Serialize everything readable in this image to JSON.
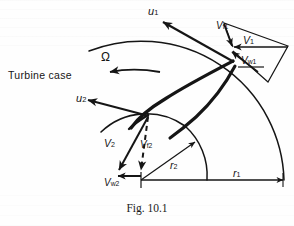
{
  "figure": {
    "caption": "Fig. 10.1",
    "ink_color": "#151515",
    "background_color": "#fefefe"
  },
  "annotations": {
    "turbine_case": "Turbine case",
    "omega": "Ω",
    "blade_speed_inlet": "u",
    "blade_speed_inlet_sub": "1",
    "blade_speed_outlet": "u",
    "blade_speed_outlet_sub": "2",
    "abs_velocity_inlet": "V",
    "abs_velocity_inlet_sub": "1",
    "flow_velocity_inlet": "V",
    "flow_velocity_inlet_sub": "f1",
    "whirl_velocity_inlet": "V",
    "whirl_velocity_inlet_sub": "w1",
    "abs_velocity_outlet": "V",
    "abs_velocity_outlet_sub": "2",
    "flow_velocity_outlet": "V",
    "flow_velocity_outlet_sub": "f2",
    "whirl_velocity_outlet": "V",
    "whirl_velocity_outlet_sub": "w2",
    "radius_outer": "r",
    "radius_outer_sub": "1",
    "radius_inner": "r",
    "radius_inner_sub": "2"
  },
  "geometry": {
    "hub_center_x": 141,
    "hub_center_y": 180,
    "outer_radius_px": 143,
    "inner_radius_px": 66,
    "inlet_tip_x": 233,
    "inlet_tip_y": 61,
    "outlet_tip_x": 148,
    "outlet_tip_y": 115
  }
}
